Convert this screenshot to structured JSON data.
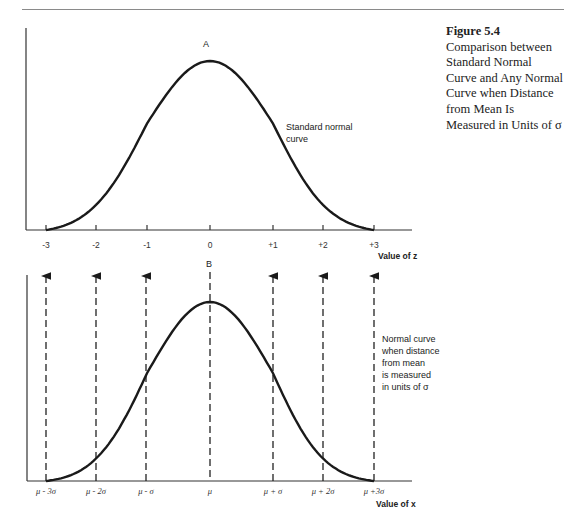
{
  "caption": {
    "number": "Figure 5.4",
    "text": "Comparison between Standard Normal Curve and Any Normal Curve when Distance from Mean Is Measured in Units of σ"
  },
  "panel_a": {
    "label": "A",
    "curve_label_line1": "Standard normal",
    "curve_label_line2": "curve",
    "ticks": [
      "-3",
      "-2",
      "-1",
      "0",
      "+1",
      "+2",
      "+3"
    ],
    "axis_title": "Value of z"
  },
  "panel_b": {
    "label": "B",
    "note_lines": [
      "Normal curve",
      "when distance",
      "from mean",
      "is measured",
      "in units of σ"
    ],
    "ticks": [
      "μ - 3σ",
      "μ - 2σ",
      "μ - σ",
      "μ",
      "μ + σ",
      "μ + 2σ",
      "μ +3σ"
    ],
    "axis_title": "Value of x"
  },
  "chart_data": [
    {
      "type": "line",
      "title": "A",
      "series": [
        {
          "name": "Standard normal curve",
          "x": [
            -3,
            -2,
            -1,
            0,
            1,
            2,
            3
          ],
          "y": [
            0.004,
            0.054,
            0.242,
            0.399,
            0.242,
            0.054,
            0.004
          ]
        }
      ],
      "xlabel": "Value of z",
      "ylabel": "",
      "x_ticks": [
        "-3",
        "-2",
        "-1",
        "0",
        "+1",
        "+2",
        "+3"
      ],
      "xlim": [
        -3,
        3
      ],
      "grid": false
    },
    {
      "type": "line",
      "title": "B",
      "series": [
        {
          "name": "Normal curve when distance from mean is measured in units of σ",
          "x": [
            -3,
            -2,
            -1,
            0,
            1,
            2,
            3
          ],
          "y": [
            0.004,
            0.054,
            0.242,
            0.399,
            0.242,
            0.054,
            0.004
          ]
        }
      ],
      "xlabel": "Value of x",
      "ylabel": "",
      "x_ticks": [
        "μ - 3σ",
        "μ - 2σ",
        "μ - σ",
        "μ",
        "μ + σ",
        "μ + 2σ",
        "μ +3σ"
      ],
      "annotations": [
        "Dashed vertical arrows at each σ mark"
      ],
      "grid": false
    }
  ]
}
